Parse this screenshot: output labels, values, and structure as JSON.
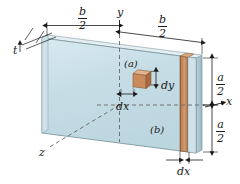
{
  "figure": {
    "type": "isometric-engineering-diagram"
  },
  "axes": {
    "y_label": "y",
    "x_label": "x",
    "z_label": "z"
  },
  "dimensions": {
    "thickness_label": "t",
    "half_width_left": {
      "numerator": "b",
      "denominator": "2"
    },
    "half_width_right": {
      "numerator": "b",
      "denominator": "2"
    },
    "half_height_top": {
      "numerator": "a",
      "denominator": "2"
    },
    "half_height_bottom": {
      "numerator": "a",
      "denominator": "2"
    }
  },
  "callouts": {
    "element_a": "(a)",
    "element_b": "(b)"
  },
  "differentials": {
    "dy": "dy",
    "dx_element": "dx",
    "dx_strip": "dx"
  },
  "colors": {
    "plate_face": "#c3dbe3",
    "plate_face_light": "#d6e7ed",
    "plate_edge": "#8fa7b0",
    "plate_side": "#a9c4ce",
    "plate_top": "#e8f1f4",
    "strip_brown": "#b5764a",
    "strip_brown_dark": "#8e5733",
    "strip_brown_light": "#d09a70",
    "cube_face": "#c98a5c",
    "cube_top": "#e0b089",
    "cube_side": "#a9683f",
    "line": "#1a1a1a",
    "dash": "#555555"
  }
}
